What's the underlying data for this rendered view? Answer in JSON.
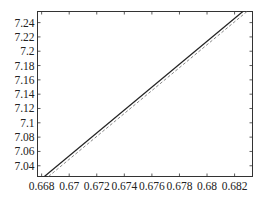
{
  "chart_data": {
    "type": "line",
    "title": "",
    "xlabel": "",
    "ylabel": "",
    "xlim": [
      0.6677,
      0.6833
    ],
    "ylim": [
      7.025,
      7.2555
    ],
    "grid": false,
    "legend": null,
    "x_ticks": [
      "0.668",
      "0.67",
      "0.672",
      "0.674",
      "0.676",
      "0.678",
      "0.68",
      "0.682"
    ],
    "x_tick_values": [
      0.668,
      0.67,
      0.672,
      0.674,
      0.676,
      0.678,
      0.68,
      0.682
    ],
    "y_ticks": [
      "7.04",
      "7.06",
      "7.08",
      "7.1",
      "7.12",
      "7.14",
      "7.16",
      "7.18",
      "7.2",
      "7.22",
      "7.24"
    ],
    "y_tick_values": [
      7.04,
      7.06,
      7.08,
      7.1,
      7.12,
      7.14,
      7.16,
      7.18,
      7.2,
      7.22,
      7.24
    ],
    "series": [
      {
        "name": "solid",
        "style": "solid",
        "color": "#222222",
        "x": [
          0.6682,
          0.6826
        ],
        "y": [
          7.025,
          7.2555
        ]
      },
      {
        "name": "dashed",
        "style": "dashed",
        "color": "#888888",
        "x": [
          0.6685,
          0.6829
        ],
        "y": [
          7.025,
          7.2555
        ]
      }
    ]
  }
}
